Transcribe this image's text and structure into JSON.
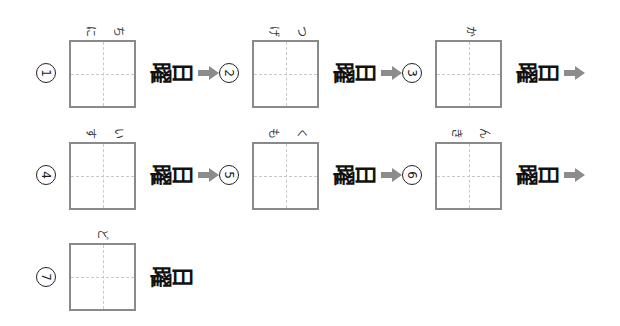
{
  "worksheet": {
    "orientation": "rotated-90-clockwise",
    "suffix": {
      "you": "曜",
      "bi": "日"
    },
    "colors": {
      "box_border": "#8a8a8a",
      "guide_line": "#c8c8c8",
      "arrow": "#8c8c8c",
      "text": "#111111"
    },
    "items": [
      {
        "number": "1",
        "circled": "①",
        "reading": [
          "に",
          "ち"
        ],
        "has_arrow": true
      },
      {
        "number": "2",
        "circled": "②",
        "reading": [
          "げ",
          "つ"
        ],
        "has_arrow": true
      },
      {
        "number": "3",
        "circled": "③",
        "reading": [
          "か"
        ],
        "has_arrow": true
      },
      {
        "number": "4",
        "circled": "④",
        "reading": [
          "す",
          "い"
        ],
        "has_arrow": true
      },
      {
        "number": "5",
        "circled": "⑤",
        "reading": [
          "も",
          "く"
        ],
        "has_arrow": true
      },
      {
        "number": "6",
        "circled": "⑥",
        "reading": [
          "き",
          "ん"
        ],
        "has_arrow": true
      },
      {
        "number": "7",
        "circled": "⑦",
        "reading": [
          "ど"
        ],
        "has_arrow": false
      }
    ]
  }
}
